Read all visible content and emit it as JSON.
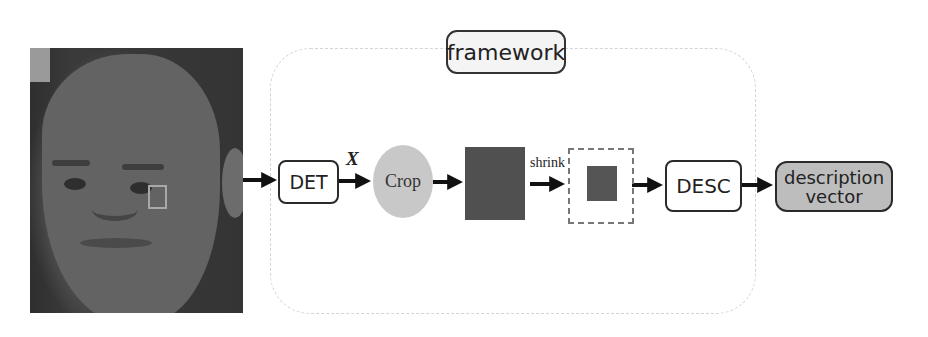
{
  "diagram": {
    "input_image": {
      "description": "face photo with small square patch highlighted on cheek"
    },
    "container_label": "framework",
    "nodes": [
      {
        "id": "det",
        "label": "DET",
        "shape": "rounded-rect"
      },
      {
        "id": "crop",
        "label": "Crop",
        "shape": "ellipse",
        "fill": "#c8c8c8"
      },
      {
        "id": "patch",
        "label": "",
        "shape": "dark-square",
        "fill": "#505050"
      },
      {
        "id": "shrunk",
        "label": "",
        "shape": "dashed-box-with-small-square"
      },
      {
        "id": "desc",
        "label": "DESC",
        "shape": "rounded-rect"
      },
      {
        "id": "output",
        "label_line1": "description",
        "label_line2": "vector",
        "shape": "rounded-rect",
        "fill": "#bdbdbd"
      }
    ],
    "edges": [
      {
        "from": "input_image",
        "to": "det",
        "label": ""
      },
      {
        "from": "det",
        "to": "crop",
        "label": "X"
      },
      {
        "from": "crop",
        "to": "patch",
        "label": ""
      },
      {
        "from": "patch",
        "to": "shrunk",
        "label": "shrink"
      },
      {
        "from": "shrunk",
        "to": "desc",
        "label": ""
      },
      {
        "from": "desc",
        "to": "output",
        "label": ""
      }
    ]
  }
}
